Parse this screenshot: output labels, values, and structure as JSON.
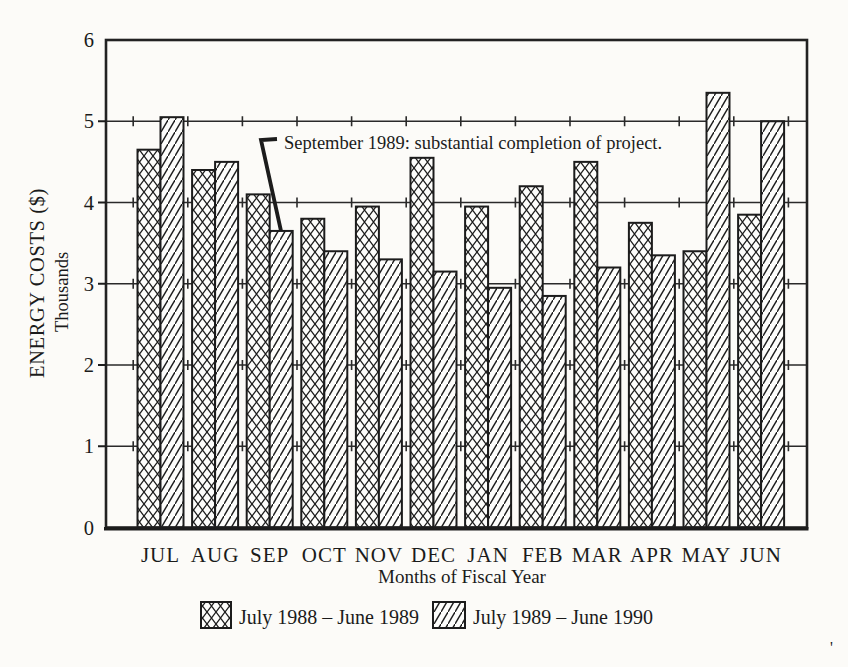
{
  "page": {
    "paper_color": "#fcfbf8",
    "ink_color": "#1c1c1c",
    "scan_speck": "'"
  },
  "chart_data": {
    "type": "bar",
    "title": "",
    "ylabel": "ENERGY COSTS ($)",
    "ylabel_secondary": "Thousands",
    "xlabel": "Months of Fiscal Year",
    "ylim": [
      0,
      6
    ],
    "yticks": [
      0,
      1,
      2,
      3,
      4,
      5,
      6
    ],
    "grid": "horizontal gridlines at 1-5 with small vertical tick crossings at month boundaries",
    "legend_position": "bottom",
    "categories": [
      "JUL",
      "AUG",
      "SEP",
      "OCT",
      "NOV",
      "DEC",
      "JAN",
      "FEB",
      "MAR",
      "APR",
      "MAY",
      "JUN"
    ],
    "series": [
      {
        "name": "July 1988 – June 1989",
        "pattern": "crosshatch",
        "values": [
          4.65,
          4.4,
          4.1,
          3.8,
          3.95,
          4.55,
          3.95,
          4.2,
          4.5,
          3.75,
          3.4,
          3.85
        ]
      },
      {
        "name": "July 1989 – June 1990",
        "pattern": "diagonal",
        "values": [
          5.05,
          4.5,
          3.65,
          3.4,
          3.3,
          3.15,
          2.95,
          2.85,
          3.2,
          3.35,
          5.35,
          5.0
        ]
      }
    ],
    "annotation": {
      "text": "September 1989: substantial completion of project.",
      "target": "SEP bar of July 1989 – June 1990 series"
    }
  }
}
